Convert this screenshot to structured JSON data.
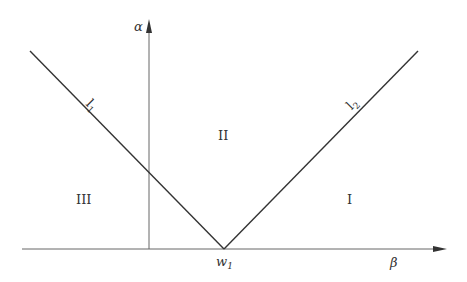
{
  "diagram": {
    "axes": {
      "vertical_label": "α",
      "horizontal_label": "β"
    },
    "vertex_label": {
      "main": "w",
      "sub": "1"
    },
    "lines": [
      {
        "id": "l1",
        "main": "l",
        "sub": "1"
      },
      {
        "id": "l2",
        "main": "l",
        "sub": "2"
      }
    ],
    "regions": {
      "top": "II",
      "left": "III",
      "right": "I"
    },
    "colors": {
      "line": "#333333",
      "axis": "#555555"
    }
  }
}
